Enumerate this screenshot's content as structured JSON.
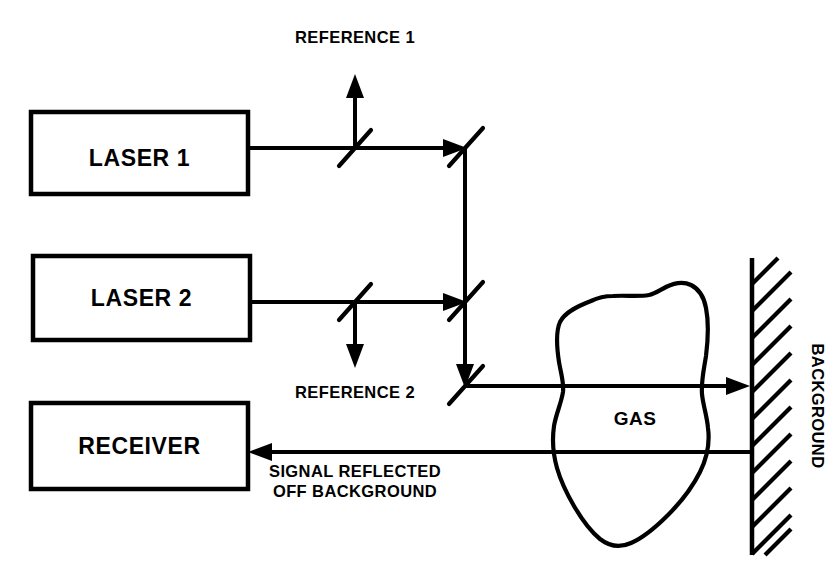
{
  "diagram": {
    "background_color": "#ffffff",
    "line_color": "#000000",
    "boxes": [
      {
        "id": "laser1",
        "label": "LASER 1"
      },
      {
        "id": "laser2",
        "label": "LASER 2"
      },
      {
        "id": "receiver",
        "label": "RECEIVER"
      }
    ],
    "labels": {
      "reference_1": "REFERENCE 1",
      "reference_2": "REFERENCE 2",
      "gas": "GAS",
      "background": "BACKGROUND",
      "signal_line_1": "SIGNAL REFLECTED",
      "signal_line_2": "OFF BACKGROUND"
    }
  }
}
